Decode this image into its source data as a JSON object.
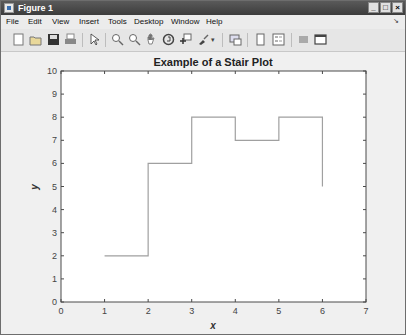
{
  "window": {
    "title": "Figure 1",
    "controls": {
      "minimize": "_",
      "maximize": "□",
      "close": "×"
    }
  },
  "menubar": {
    "items": [
      "File",
      "Edit",
      "View",
      "Insert",
      "Tools",
      "Desktop",
      "Window",
      "Help"
    ],
    "dock_arrow": "↘"
  },
  "toolbar": {
    "icons": [
      "new-figure",
      "open-file",
      "save",
      "print",
      "edit-plot-arrow",
      "zoom-in",
      "zoom-out",
      "pan",
      "rotate-3d",
      "data-cursor",
      "brush",
      "link-plot",
      "colorbar",
      "legend",
      "hide-plot-tools",
      "show-plot-tools"
    ]
  },
  "chart_data": {
    "type": "line",
    "subtype": "stairs",
    "title": "Example of a Stair Plot",
    "xlabel": "x",
    "ylabel": "y",
    "xlim": [
      0,
      7
    ],
    "ylim": [
      0,
      10
    ],
    "xticks": [
      "0",
      "1",
      "2",
      "3",
      "4",
      "5",
      "6",
      "7"
    ],
    "yticks": [
      "0",
      "1",
      "2",
      "3",
      "4",
      "5",
      "6",
      "7",
      "8",
      "9",
      "10"
    ],
    "grid": false,
    "legend": null,
    "series": [
      {
        "name": "stairs",
        "x": [
          1,
          2,
          3,
          4,
          5,
          6
        ],
        "y": [
          2,
          6,
          8,
          7,
          8,
          5
        ],
        "color": "#a0a0a0"
      }
    ]
  }
}
